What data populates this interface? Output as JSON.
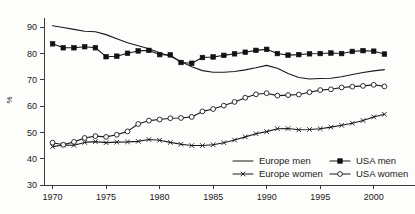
{
  "chart_data": {
    "type": "line",
    "title": "",
    "xlabel": "",
    "ylabel": "%",
    "xlim": [
      1969.2,
      2001.8
    ],
    "ylim": [
      30,
      92
    ],
    "grid": false,
    "legend_position": "bottom-right",
    "x": [
      1970,
      1971,
      1972,
      1973,
      1974,
      1975,
      1976,
      1977,
      1978,
      1979,
      1980,
      1981,
      1982,
      1983,
      1984,
      1985,
      1986,
      1987,
      1988,
      1989,
      1990,
      1991,
      1992,
      1993,
      1994,
      1995,
      1996,
      1997,
      1998,
      1999,
      2000,
      2001
    ],
    "x_ticks": [
      1970,
      1975,
      1980,
      1985,
      1990,
      1995,
      2000
    ],
    "x_tick_labels": [
      "1970",
      "1975",
      "1980",
      "1985",
      "1990",
      "1995",
      "2000"
    ],
    "y_ticks": [
      30,
      40,
      50,
      60,
      70,
      80,
      90
    ],
    "y_tick_labels": [
      "30",
      "40",
      "50",
      "60",
      "70",
      "80",
      "90"
    ],
    "series": [
      {
        "name": "Europe men",
        "marker": "none",
        "values": [
          90.6,
          89.9,
          89.2,
          88.5,
          88.3,
          87.2,
          85.6,
          84.1,
          83.0,
          81.8,
          80.3,
          79.0,
          77.0,
          75.0,
          73.5,
          72.9,
          72.9,
          73.2,
          73.8,
          74.6,
          75.5,
          74.4,
          72.4,
          70.9,
          70.3,
          70.5,
          70.6,
          71.2,
          72.0,
          72.8,
          73.4,
          73.9
        ]
      },
      {
        "name": "Europe women",
        "marker": "x",
        "values": [
          44.6,
          45.2,
          45.1,
          46.2,
          46.5,
          46.1,
          46.3,
          46.4,
          46.6,
          47.3,
          47.0,
          46.2,
          45.5,
          45.0,
          45.0,
          45.3,
          46.1,
          47.1,
          48.3,
          49.5,
          50.3,
          51.4,
          51.5,
          51.0,
          51.1,
          51.4,
          52.0,
          52.7,
          53.5,
          54.5,
          55.9,
          56.9
        ]
      },
      {
        "name": "USA men",
        "marker": "square-filled",
        "values": [
          83.7,
          82.2,
          82.2,
          82.6,
          82.2,
          78.8,
          79.0,
          80.1,
          81.0,
          81.2,
          79.6,
          79.5,
          76.6,
          76.3,
          78.5,
          78.7,
          79.3,
          79.9,
          80.5,
          81.2,
          81.6,
          80.0,
          79.4,
          79.6,
          79.9,
          80.0,
          80.2,
          80.0,
          80.8,
          81.1,
          80.9,
          79.8
        ]
      },
      {
        "name": "USA women",
        "marker": "circle-open",
        "values": [
          46.1,
          45.3,
          46.4,
          47.9,
          48.6,
          48.3,
          49.1,
          50.4,
          53.2,
          54.5,
          54.9,
          55.4,
          55.5,
          55.9,
          58.0,
          58.9,
          60.2,
          61.6,
          63.2,
          64.5,
          64.9,
          64.0,
          64.2,
          64.4,
          65.3,
          66.1,
          66.4,
          67.1,
          67.4,
          67.7,
          68.1,
          67.5
        ]
      }
    ]
  },
  "axis": {
    "y_title": "%"
  },
  "legend": {
    "items": [
      {
        "label": "Europe men",
        "marker": "none"
      },
      {
        "label": "USA men",
        "marker": "square-filled"
      },
      {
        "label": "Europe women",
        "marker": "x"
      },
      {
        "label": "USA women",
        "marker": "circle-open"
      }
    ]
  }
}
